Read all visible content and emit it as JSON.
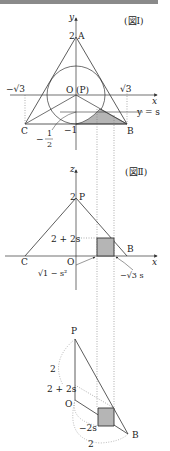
{
  "figure1": {
    "title": "(図Ⅰ)",
    "y_axis": "y",
    "x_axis": "x",
    "A": "A",
    "A_val": "2",
    "O": "O",
    "P_paren": "(P)",
    "neg_sqrt3": "−√3",
    "sqrt3": "√3",
    "C": "C",
    "B": "B",
    "neg1": "−1",
    "neg_half_num": "1",
    "neg_half_den": "2",
    "neg_sign": "−",
    "line_label": "y = s"
  },
  "figure2": {
    "title": "(図Ⅱ)",
    "z_axis": "z",
    "x_axis": "x",
    "P": "P",
    "P_val": "2",
    "height_label": "2 + 2s",
    "C": "C",
    "O": "O",
    "B": "B",
    "left_arrow_label": "√1 − s²",
    "right_arrow_label": "−√3 s"
  },
  "figure3": {
    "P": "P",
    "O": "O",
    "B": "B",
    "arc_top_label": "2",
    "height_label": "2 + 2s",
    "inner_arc_label": "−2s",
    "bottom_arc_label": "2"
  },
  "colors": {
    "line": "#333333",
    "shade": "#b5b5b5",
    "dotted": "#777777"
  }
}
